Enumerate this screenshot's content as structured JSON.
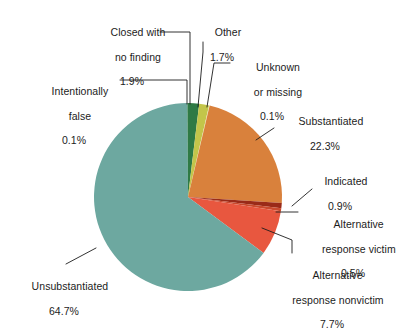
{
  "chart_data": {
    "type": "pie",
    "title": "",
    "subtitle": "",
    "xlabel": "",
    "ylabel": "",
    "legend_position": "callout-labels",
    "grid": false,
    "units": "percent",
    "total": 100.0,
    "start_angle_deg": 0,
    "direction": "clockwise",
    "categories": [
      "Closed with no finding",
      "Other",
      "Unknown or missing",
      "Substantiated",
      "Indicated",
      "Alternative response victim",
      "Alternative response nonvictim",
      "Unsubstantiated",
      "Intentionally false"
    ],
    "values": [
      1.9,
      1.7,
      0.1,
      22.3,
      0.9,
      0.5,
      7.7,
      64.7,
      0.1
    ],
    "colors": [
      "#2f7a45",
      "#c3c54a",
      "#e8e6a8",
      "#d9813c",
      "#9a2a18",
      "#c94a2e",
      "#e8573f",
      "#6da8a0",
      "#2f7a45"
    ],
    "slices": [
      {
        "label": "Closed with no finding",
        "value": 1.9,
        "display_value": "1.9%",
        "color": "#2f7a45"
      },
      {
        "label": "Other",
        "value": 1.7,
        "display_value": "1.7%",
        "color": "#c3c54a"
      },
      {
        "label": "Unknown or missing",
        "value": 0.1,
        "display_value": "0.1%",
        "color": "#e8e6a8"
      },
      {
        "label": "Substantiated",
        "value": 22.3,
        "display_value": "22.3%",
        "color": "#d9813c"
      },
      {
        "label": "Indicated",
        "value": 0.9,
        "display_value": "0.9%",
        "color": "#9a2a18"
      },
      {
        "label": "Alternative response victim",
        "value": 0.5,
        "display_value": "0.5%",
        "color": "#c94a2e"
      },
      {
        "label": "Alternative response nonvictim",
        "value": 7.7,
        "display_value": "7.7%",
        "color": "#e8573f"
      },
      {
        "label": "Unsubstantiated",
        "value": 64.7,
        "display_value": "64.7%",
        "color": "#6da8a0"
      },
      {
        "label": "Intentionally false",
        "value": 0.1,
        "display_value": "0.1%",
        "color": "#2f7a45"
      }
    ]
  },
  "labels": {
    "closed": {
      "line1": "Closed with",
      "line2": "no finding",
      "pct": "1.9%"
    },
    "other": {
      "line1": "Other",
      "line2": "",
      "pct": "1.7%"
    },
    "unknown": {
      "line1": "Unknown",
      "line2": "or missing",
      "pct": "0.1%"
    },
    "intentionally_false": {
      "line1": "Intentionally",
      "line2": "false",
      "pct": "0.1%"
    },
    "substantiated": {
      "line1": "Substantiated",
      "line2": "",
      "pct": "22.3%"
    },
    "indicated": {
      "line1": "Indicated",
      "line2": "",
      "pct": "0.9%"
    },
    "alt_response_victim": {
      "line1": "Alternative",
      "line2": "response victim",
      "pct": "0.5%"
    },
    "alt_response_nonvictim": {
      "line1": "Alternative",
      "line2": "response nonvictim",
      "pct": "7.7%"
    },
    "unsubstantiated": {
      "line1": "Unsubstantiated",
      "line2": "",
      "pct": "64.7%"
    }
  },
  "style": {
    "background": "#ffffff",
    "text_color": "#1c1c1c",
    "leader_color": "#1c1c1c"
  }
}
